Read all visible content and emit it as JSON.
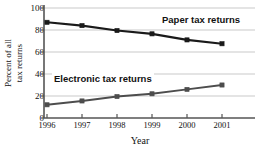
{
  "chart_data": {
    "type": "line",
    "title": "",
    "xlabel": "Year",
    "ylabel_line1": "Percent of all",
    "ylabel_line2": "tax returns",
    "categories": [
      "1996",
      "1997",
      "1998",
      "1999",
      "2000",
      "2001"
    ],
    "x": [
      1996,
      1997,
      1998,
      1999,
      2000,
      2001
    ],
    "ylim": [
      0,
      100
    ],
    "yticks": [
      0,
      20,
      40,
      60,
      80,
      100
    ],
    "ytick_labels": [
      "0",
      "20",
      "40",
      "60",
      "80",
      "100"
    ],
    "grid": true,
    "grid_axis": "y",
    "legend_position": "inline-annotations",
    "series": [
      {
        "name": "Paper tax returns",
        "values": [
          87,
          84,
          79.5,
          76.5,
          71,
          67.5
        ],
        "color": "#1a1a1a",
        "marker": "square"
      },
      {
        "name": "Electronic tax returns",
        "values": [
          12,
          15.5,
          19.5,
          22,
          26,
          30
        ],
        "color": "#4d4d4d",
        "marker": "square"
      }
    ],
    "annotations": [
      {
        "text": "Paper tax returns",
        "series": "Paper tax returns"
      },
      {
        "text": "Electronic tax returns",
        "series": "Electronic tax returns"
      }
    ]
  },
  "colors": {
    "axis": "#555555",
    "grid": "#c9c9c9",
    "paper_series": "#1a1a1a",
    "electronic_series": "#4d4d4d",
    "text": "#111111",
    "background": "#ffffff"
  }
}
